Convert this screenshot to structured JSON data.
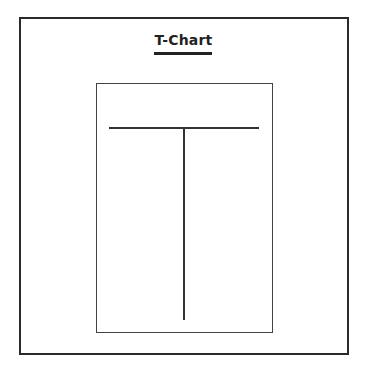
{
  "title": "T-Chart",
  "diagram": {
    "type": "t-chart",
    "columns": [
      {
        "header": "",
        "items": []
      },
      {
        "header": "",
        "items": []
      }
    ]
  },
  "colors": {
    "line": "#333333",
    "background": "#ffffff"
  }
}
